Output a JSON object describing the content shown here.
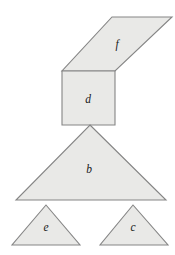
{
  "figure": {
    "background_color": "#ffffff",
    "canvas": {
      "width": 175,
      "height": 255
    },
    "style": {
      "fill_color": "#e9e9e7",
      "stroke_color": "#858585",
      "label_color": "#1a1a1a",
      "stroke_width": 1.1,
      "label_font_size": 11.5
    },
    "shapes": [
      {
        "id": "f",
        "label": "f",
        "kind": "parallelogram",
        "points": "112,17 172,17 115,71 62,71",
        "label_x": 117,
        "label_y": 45
      },
      {
        "id": "d",
        "label": "d",
        "kind": "square",
        "points": "62,71 115,71 115,125 62,125",
        "label_x": 88,
        "label_y": 100
      },
      {
        "id": "b",
        "label": "b",
        "kind": "triangle-large",
        "points": "90,125 166,200 16,200",
        "label_x": 89,
        "label_y": 170
      },
      {
        "id": "e",
        "label": "e",
        "kind": "triangle-small",
        "points": "46,205 80,245 12,245",
        "label_x": 46,
        "label_y": 228
      },
      {
        "id": "c",
        "label": "c",
        "kind": "triangle-small",
        "points": "133,205 168,245 100,245",
        "label_x": 133,
        "label_y": 228
      }
    ]
  }
}
